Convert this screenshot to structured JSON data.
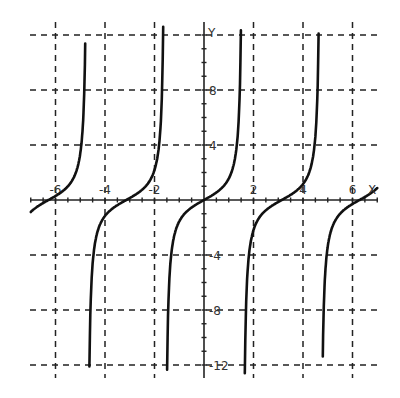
{
  "chart_data": {
    "type": "line",
    "title": "",
    "function": "y = tan(x)",
    "xlabel": "X",
    "ylabel": "Y",
    "xlim": [
      -7,
      7
    ],
    "ylim": [
      -12.5,
      12.5
    ],
    "x_ticks": [
      -6,
      -4,
      -2,
      2,
      4,
      6
    ],
    "x_tick_labels": [
      "-6",
      "-4",
      "-2",
      "2",
      "4",
      "6"
    ],
    "y_ticks": [
      8,
      4,
      -4,
      -8,
      -12
    ],
    "y_tick_labels": [
      "8",
      "4",
      "-4",
      "-8",
      "-12"
    ],
    "grid": true,
    "grid_style": "dashed",
    "grid_x": [
      -6,
      -4,
      -2,
      2,
      4,
      6
    ],
    "grid_y": [
      12,
      8,
      4,
      -4,
      -8,
      -12
    ],
    "asymptotes": [
      -4.712,
      -1.571,
      1.571,
      4.712
    ],
    "series": [
      {
        "name": "tan(x)",
        "x": [
          -7.0,
          -6.5,
          -6.283,
          -6.0,
          -5.5,
          -5.0,
          -4.9,
          -4.8
        ],
        "y": [
          -0.87,
          -0.22,
          0.0,
          0.29,
          0.71,
          3.38,
          5.27,
          11.38
        ]
      },
      {
        "name": "tan(x)",
        "x": [
          -4.63,
          -4.5,
          -4.0,
          -3.5,
          -3.142,
          -3.0,
          -2.5,
          -2.0,
          -1.8,
          -1.65
        ],
        "y": [
          -12.0,
          -4.64,
          -1.16,
          -0.37,
          0.0,
          0.14,
          0.75,
          2.19,
          4.29,
          12.6
        ]
      },
      {
        "name": "tan(x)",
        "x": [
          -1.49,
          -1.4,
          -1.2,
          -1.0,
          -0.5,
          0.0,
          0.5,
          1.0,
          1.2,
          1.4,
          1.49
        ],
        "y": [
          -12.0,
          -5.8,
          -2.57,
          -1.56,
          -0.55,
          0.0,
          0.55,
          1.56,
          2.57,
          5.8,
          12.0
        ]
      },
      {
        "name": "tan(x)",
        "x": [
          1.65,
          1.8,
          2.0,
          2.5,
          3.0,
          3.142,
          3.5,
          4.0,
          4.5,
          4.63
        ],
        "y": [
          -12.6,
          -4.29,
          -2.19,
          -0.75,
          -0.14,
          0.0,
          0.37,
          1.16,
          4.64,
          12.0
        ]
      },
      {
        "name": "tan(x)",
        "x": [
          4.8,
          4.9,
          5.0,
          5.5,
          6.0,
          6.283,
          7.0
        ],
        "y": [
          -11.38,
          -5.27,
          -3.38,
          -0.71,
          -0.29,
          0.0,
          0.87
        ]
      }
    ],
    "legend": []
  },
  "axes": {
    "x_label": "X",
    "y_label": "Y"
  }
}
